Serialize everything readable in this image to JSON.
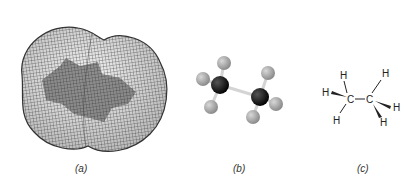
{
  "figure": {
    "panels": [
      {
        "id": "a",
        "label": "(a)",
        "description": "Electron density isosurface (wireframe mesh) enclosing ethane molecule"
      },
      {
        "id": "b",
        "label": "(b)",
        "description": "Ball-and-stick model of ethane"
      },
      {
        "id": "c",
        "label": "(c)",
        "description": "Wedge-dash structural formula of ethane"
      }
    ],
    "structural_formula": {
      "carbons": [
        "C",
        "C"
      ],
      "hydrogens": [
        "H",
        "H",
        "H",
        "H",
        "H",
        "H"
      ]
    },
    "colors": {
      "mesh": "#3a3a3a",
      "surface": "#8a8a8a",
      "carbon_atom": "#111111",
      "hydrogen_atom": "#a8a8a8",
      "bond": "#cfcfcf"
    }
  }
}
